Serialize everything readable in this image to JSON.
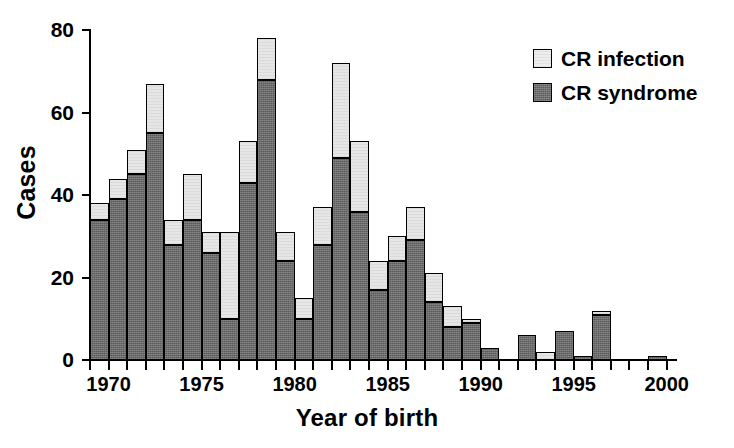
{
  "chart_data": {
    "type": "bar",
    "subtype": "stacked-vertical",
    "title": "",
    "xlabel": "Year of birth",
    "ylabel": "Cases",
    "xlim": [
      1969,
      2000.5
    ],
    "ylim": [
      0,
      80
    ],
    "y_ticks": [
      0,
      20,
      40,
      60,
      80
    ],
    "y_tick_labels": [
      "0",
      "20",
      "40",
      "60",
      "80"
    ],
    "x_tick_labels_shown": [
      "1970",
      "1975",
      "1980",
      "1985",
      "1990",
      "1995",
      "2000"
    ],
    "x_tick_years_all": [
      1969,
      1970,
      1971,
      1972,
      1973,
      1974,
      1975,
      1976,
      1977,
      1978,
      1979,
      1980,
      1981,
      1982,
      1983,
      1984,
      1985,
      1986,
      1987,
      1988,
      1989,
      1990,
      1991,
      1992,
      1993,
      1994,
      1995,
      1996,
      1997,
      1998,
      1999,
      2000
    ],
    "grid": false,
    "legend_position": "top-right",
    "categories": [
      1969,
      1970,
      1971,
      1972,
      1973,
      1974,
      1975,
      1976,
      1977,
      1978,
      1979,
      1980,
      1981,
      1982,
      1983,
      1984,
      1985,
      1986,
      1987,
      1988,
      1989,
      1990,
      1991,
      1992,
      1993,
      1994,
      1995,
      1996,
      1997,
      1998,
      1999
    ],
    "series": [
      {
        "name": "CR syndrome",
        "color": "#5b5b5b",
        "values": [
          34,
          39,
          45,
          55,
          28,
          34,
          26,
          10,
          43,
          68,
          24,
          10,
          28,
          49,
          36,
          17,
          24,
          29,
          14,
          8,
          9,
          3,
          0,
          6,
          0,
          7,
          1,
          11,
          0,
          0,
          1
        ]
      },
      {
        "name": "CR infection",
        "color": "#e6e6e6",
        "values": [
          4,
          5,
          6,
          12,
          6,
          11,
          5,
          21,
          10,
          10,
          7,
          5,
          9,
          23,
          17,
          7,
          6,
          8,
          7,
          5,
          1,
          0,
          0,
          0,
          2,
          0,
          0,
          1,
          0,
          0,
          0
        ]
      }
    ],
    "totals": [
      38,
      44,
      51,
      67,
      34,
      45,
      31,
      31,
      53,
      78,
      31,
      15,
      37,
      72,
      53,
      24,
      30,
      37,
      21,
      13,
      10,
      3,
      0,
      6,
      2,
      7,
      1,
      12,
      0,
      0,
      1
    ]
  },
  "legend": {
    "items": [
      {
        "label": "CR infection",
        "swatch": "light-square-swatch"
      },
      {
        "label": "CR syndrome",
        "swatch": "dark-square-swatch"
      }
    ]
  },
  "axes": {
    "y_title": "Cases",
    "x_title": "Year of birth"
  }
}
